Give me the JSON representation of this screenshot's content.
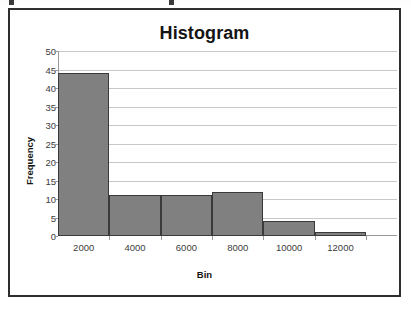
{
  "chart_data": {
    "type": "bar",
    "title": "Histogram",
    "xlabel": "Bin",
    "ylabel": "Frequency",
    "categories": [
      "2000",
      "4000",
      "6000",
      "8000",
      "10000",
      "12000"
    ],
    "values": [
      44,
      11,
      11,
      12,
      4,
      1
    ],
    "ylim": [
      0,
      50
    ],
    "yticks": [
      0,
      5,
      10,
      15,
      20,
      25,
      30,
      35,
      40,
      45,
      50
    ],
    "ytick_labels": [
      "0",
      "5",
      "10",
      "15",
      "20",
      "25",
      "30",
      "35",
      "40",
      "45",
      "50"
    ],
    "grid": true,
    "legend": false,
    "series": [
      {
        "name": "Frequency",
        "values": [
          44,
          11,
          11,
          12,
          4,
          1
        ]
      }
    ],
    "colors": {
      "bar_fill": "#808080",
      "bar_border": "#3a3a3a",
      "gridline": "#c8c8c8",
      "axis": "#9a9a9a",
      "text": "#3d3d3d",
      "title": "#141414",
      "frame_border": "#2e2e2e",
      "background": "#ffffff"
    }
  }
}
